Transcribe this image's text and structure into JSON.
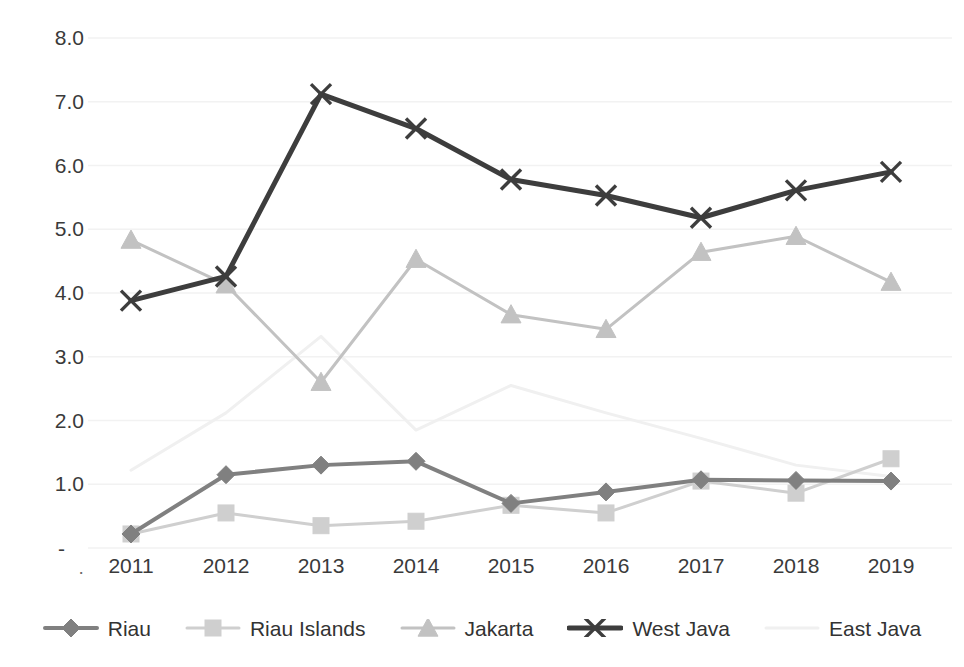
{
  "chart_data": {
    "type": "line",
    "title": "",
    "subtitle": "",
    "xlabel": "",
    "ylabel": "",
    "categories": [
      "2011",
      "2012",
      "2013",
      "2014",
      "2015",
      "2016",
      "2017",
      "2018",
      "2019"
    ],
    "x_tick_labels": [
      "2011",
      "2012",
      "2013",
      "2014",
      "2015",
      "2016",
      "2017",
      "2018",
      "2019"
    ],
    "y_tick_labels": [
      "8.0",
      "7.0",
      "6.0",
      "5.0",
      "4.0",
      "3.0",
      "2.0",
      "1.0",
      "-"
    ],
    "y_tick_values": [
      8.0,
      7.0,
      6.0,
      5.0,
      4.0,
      3.0,
      2.0,
      1.0,
      0.0
    ],
    "ylim": [
      0.0,
      8.0
    ],
    "grid": true,
    "grid_axis": "y",
    "legend_position": "bottom",
    "zero_label": "-",
    "series": [
      {
        "name": "Riau",
        "color": "#808080",
        "marker": "diamond",
        "line_width": 4,
        "values": [
          0.22,
          1.15,
          1.3,
          1.36,
          0.7,
          0.88,
          1.07,
          1.06,
          1.05
        ]
      },
      {
        "name": "Riau Islands",
        "color": "#cfcfcf",
        "marker": "square",
        "line_width": 3,
        "values": [
          0.22,
          0.55,
          0.35,
          0.42,
          0.67,
          0.55,
          1.05,
          0.86,
          1.4
        ]
      },
      {
        "name": "Jakarta",
        "color": "#c2c2c2",
        "marker": "triangle",
        "line_width": 3,
        "values": [
          4.83,
          4.13,
          2.6,
          4.53,
          3.66,
          3.43,
          4.64,
          4.89,
          4.17
        ]
      },
      {
        "name": "West Java",
        "color": "#3d3d3d",
        "marker": "x",
        "line_width": 5,
        "values": [
          3.88,
          4.26,
          7.12,
          6.58,
          5.78,
          5.53,
          5.18,
          5.61,
          5.9
        ]
      },
      {
        "name": "East Java",
        "color": "#f0f0f0",
        "marker": "none",
        "line_width": 3,
        "values": [
          1.22,
          2.12,
          3.32,
          1.85,
          2.55,
          2.12,
          1.72,
          1.3,
          1.12
        ]
      }
    ]
  },
  "legend": {
    "items": [
      {
        "label": "Riau",
        "marker": "diamond",
        "color": "#808080"
      },
      {
        "label": "Riau Islands",
        "marker": "square",
        "color": "#cfcfcf"
      },
      {
        "label": "Jakarta",
        "marker": "triangle",
        "color": "#c2c2c2"
      },
      {
        "label": "West Java",
        "marker": "x",
        "color": "#3d3d3d"
      },
      {
        "label": "East Java",
        "marker": "none",
        "color": "#f0f0f0"
      }
    ]
  },
  "axes": {
    "origin_dot": "·",
    "zero_dash": "-"
  },
  "style": {
    "background": "#ffffff",
    "grid_color": "#f2f2f2",
    "text_color": "#3a3a3a"
  }
}
